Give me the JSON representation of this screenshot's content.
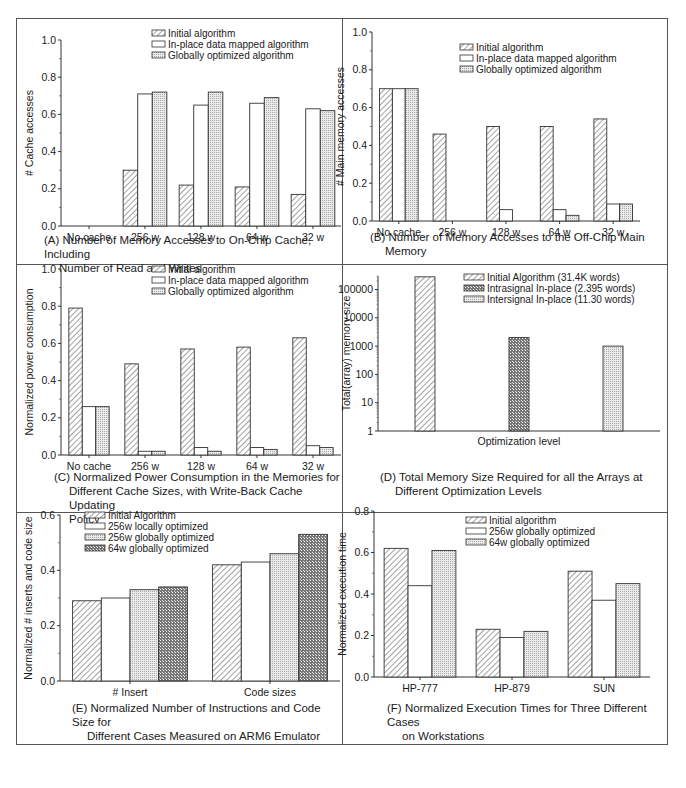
{
  "legend_sets": {
    "A": [
      "Initial algorithm",
      "In-place data mapped algorithm",
      "Globally optimized algorithm"
    ],
    "B": [
      "Initial algorithm",
      "In-place data mapped algorithm",
      "Globally optimized algorithm"
    ],
    "C": [
      "Initial algorithm",
      "In-place data mapped algorithm",
      "Globally optimized algorithm"
    ],
    "D": [
      "Initial Algorithm (31.4K words)",
      "Intrasignal In-place (2.395 words)",
      "Intersignal In-place (11.30 words)"
    ],
    "E": [
      "Initial Algorithm",
      "256w locally optimized",
      "256w globally optimized",
      "64w globally optimized"
    ],
    "F": [
      "Initial algorithm",
      "256w globally optimized",
      "64w globally optimized"
    ]
  },
  "captions": {
    "A": [
      "(A) Number of Memory Accesses to On-Chip Cache, Including",
      "Number of Read and Writes"
    ],
    "B": [
      "(B) Number of Memory Accesses to the Off-Chip Main",
      "Memory"
    ],
    "C": [
      "(C) Normalized Power Consumption in the Memories for",
      "Different Cache Sizes, with Write-Back Cache Updating",
      "Policy"
    ],
    "D": [
      "(D) Total Memory Size Required for all the Arrays at",
      "Different Optimization Levels"
    ],
    "E": [
      "(E) Normalized Number of Instructions and Code Size for",
      "Different Cases Measured on ARM6 Emulator"
    ],
    "F": [
      "(F) Normalized Execution Times for Three Different Cases",
      "on Workstations"
    ]
  },
  "chart_data": [
    {
      "id": "A",
      "type": "bar",
      "title": "(A) Number of Memory Accesses to On-Chip Cache, Including Number of Read and Writes",
      "xlabel": "",
      "ylabel": "# Cache accesses",
      "ylim": [
        0,
        1.0
      ],
      "yticks": [
        0.0,
        0.2,
        0.4,
        0.6,
        0.8,
        1.0
      ],
      "ytick_labels": [
        "0.0",
        "0.2",
        "0.4",
        "0.6",
        "0.8",
        "1.0"
      ],
      "grid": false,
      "legend_position": "top-center",
      "categories": [
        "No cache",
        "256 w",
        "128 w",
        "64 w",
        "32 w"
      ],
      "series": [
        {
          "name": "Initial algorithm",
          "pattern": "hatch",
          "values": [
            0,
            0.3,
            0.22,
            0.21,
            0.17
          ]
        },
        {
          "name": "In-place data mapped algorithm",
          "pattern": "white",
          "values": [
            0,
            0.71,
            0.65,
            0.66,
            0.63
          ]
        },
        {
          "name": "Globally optimized algorithm",
          "pattern": "dots",
          "values": [
            0,
            0.72,
            0.72,
            0.69,
            0.62
          ]
        }
      ]
    },
    {
      "id": "B",
      "type": "bar",
      "title": "(B) Number of Memory Accesses to the Off-Chip Main Memory",
      "xlabel": "",
      "ylabel": "# Main memory accesses",
      "ylim": [
        0,
        1.0
      ],
      "yticks": [
        0.0,
        0.2,
        0.4,
        0.6,
        0.8,
        1.0
      ],
      "ytick_labels": [
        "0.0",
        "0.2",
        "0.4",
        "0.6",
        "0.8",
        "1.0"
      ],
      "grid": false,
      "legend_position": "top-right",
      "categories": [
        "No cache",
        "256 w",
        "128 w",
        "64 w",
        "32 w"
      ],
      "series": [
        {
          "name": "Initial algorithm",
          "pattern": "hatch",
          "values": [
            0.7,
            0.46,
            0.5,
            0.5,
            0.54
          ]
        },
        {
          "name": "In-place data mapped algorithm",
          "pattern": "white",
          "values": [
            0.7,
            0,
            0.06,
            0.06,
            0.09
          ]
        },
        {
          "name": "Globally optimized algorithm",
          "pattern": "dots",
          "values": [
            0.7,
            0,
            0,
            0.03,
            0.09
          ]
        }
      ]
    },
    {
      "id": "C",
      "type": "bar",
      "title": "(C) Normalized Power Consumption in the Memories for Different Cache Sizes, with Write-Back Cache Updating Policy",
      "xlabel": "",
      "ylabel": "Normalized power consumption",
      "ylim": [
        0,
        1.0
      ],
      "yticks": [
        0.0,
        0.2,
        0.4,
        0.6,
        0.8,
        1.0
      ],
      "ytick_labels": [
        "0.0",
        "0.2",
        "0.4",
        "0.6",
        "0.8",
        "1.0"
      ],
      "grid": false,
      "legend_position": "top-right",
      "categories": [
        "No cache",
        "256 w",
        "128 w",
        "64 w",
        "32 w"
      ],
      "series": [
        {
          "name": "Initial algorithm",
          "pattern": "hatch",
          "values": [
            0.79,
            0.49,
            0.57,
            0.58,
            0.63
          ]
        },
        {
          "name": "In-place data mapped algorithm",
          "pattern": "white",
          "values": [
            0.26,
            0.02,
            0.04,
            0.04,
            0.05
          ]
        },
        {
          "name": "Globally optimized algorithm",
          "pattern": "dots",
          "values": [
            0.26,
            0.02,
            0.02,
            0.03,
            0.04
          ]
        }
      ]
    },
    {
      "id": "D",
      "type": "bar",
      "title": "(D) Total Memory Size Required for all the Arrays at Different Optimization Levels",
      "xlabel": "Optimization level",
      "ylabel": "Total(array) memory size",
      "yscale": "log",
      "ylim": [
        1,
        300000
      ],
      "yticks": [
        1,
        10,
        100,
        1000,
        10000,
        100000
      ],
      "ytick_labels": [
        "1",
        "10",
        "100",
        "1000",
        "10000",
        "100000"
      ],
      "grid": false,
      "legend_position": "top-right",
      "categories": [
        "Initial Algorithm (31.4K words)",
        "Intrasignal In-place (2.395 words)",
        "Intersignal In-place (11.30 words)"
      ],
      "series": [
        {
          "name": "Initial Algorithm (31.4K words)",
          "pattern": "hatch",
          "values": [
            280000
          ]
        },
        {
          "name": "Intrasignal In-place (2.395 words)",
          "pattern": "crosshatch",
          "values": [
            2000
          ]
        },
        {
          "name": "Intersignal In-place (11.30 words)",
          "pattern": "dots",
          "values": [
            1000
          ]
        }
      ]
    },
    {
      "id": "E",
      "type": "bar",
      "title": "(E) Normalized Number of Instructions and Code Size for Different Cases Measured on ARM6 Emulator",
      "xlabel": "",
      "ylabel": "Normalized # inserts and code size",
      "ylim": [
        0,
        0.6
      ],
      "yticks": [
        0.0,
        0.2,
        0.4,
        0.6
      ],
      "ytick_labels": [
        "0.0",
        "0.2",
        "0.4",
        "0.6"
      ],
      "grid": false,
      "legend_position": "top-left",
      "categories": [
        "# Insert",
        "Code sizes"
      ],
      "series": [
        {
          "name": "Initial Algorithm",
          "pattern": "hatch",
          "values": [
            0.29,
            0.42
          ]
        },
        {
          "name": "256w locally optimized",
          "pattern": "white",
          "values": [
            0.3,
            0.43
          ]
        },
        {
          "name": "256w globally optimized",
          "pattern": "dots",
          "values": [
            0.33,
            0.46
          ]
        },
        {
          "name": "64w globally optimized",
          "pattern": "crosshatch",
          "values": [
            0.34,
            0.53
          ]
        }
      ]
    },
    {
      "id": "F",
      "type": "bar",
      "title": "(F) Normalized Execution Times for Three Different Cases on Workstations",
      "xlabel": "",
      "ylabel": "Normalized execution time",
      "ylim": [
        0,
        0.8
      ],
      "yticks": [
        0.0,
        0.2,
        0.4,
        0.6,
        0.8
      ],
      "ytick_labels": [
        "0.0",
        "0.2",
        "0.4",
        "0.6",
        "0.8"
      ],
      "grid": false,
      "legend_position": "top-right",
      "categories": [
        "HP-777",
        "HP-879",
        "SUN"
      ],
      "series": [
        {
          "name": "Initial algorithm",
          "pattern": "hatch",
          "values": [
            0.62,
            0.23,
            0.51
          ]
        },
        {
          "name": "256w globally optimized",
          "pattern": "white",
          "values": [
            0.44,
            0.19,
            0.37
          ]
        },
        {
          "name": "64w globally optimized",
          "pattern": "dots",
          "values": [
            0.61,
            0.22,
            0.45
          ]
        }
      ]
    }
  ]
}
